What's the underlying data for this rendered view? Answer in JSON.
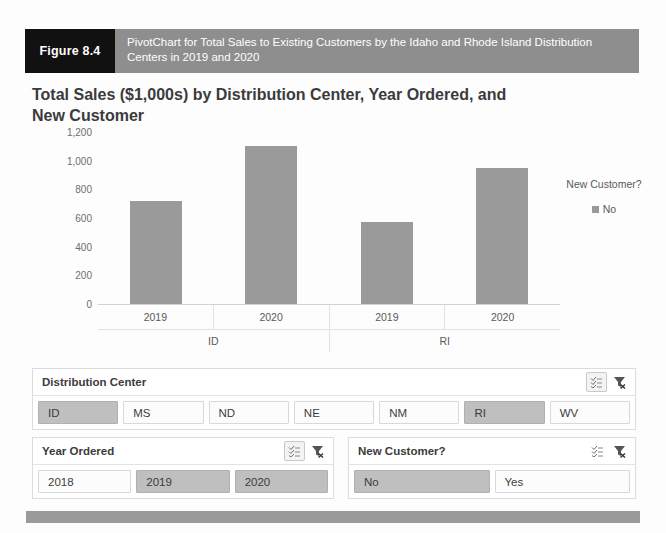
{
  "figure": {
    "number_label": "Figure 8.4",
    "caption": "PivotChart for Total Sales to Existing Customers by the Idaho and Rhode Island Distribution Centers in 2019 and 2020"
  },
  "chart_data": {
    "type": "bar",
    "title": "Total Sales ($1,000s) by Distribution Center, Year Ordered, and New Customer",
    "xlabel": "",
    "ylabel": "",
    "ylim": [
      0,
      1200
    ],
    "yticks": [
      "0",
      "200",
      "400",
      "600",
      "800",
      "1,000",
      "1,200"
    ],
    "ytick_values": [
      0,
      200,
      400,
      600,
      800,
      1000,
      1200
    ],
    "grid": false,
    "legend_position": "right",
    "legend_title": "New Customer?",
    "legend_entries": [
      {
        "label": "No",
        "color": "#9a9a9a"
      }
    ],
    "groups": [
      {
        "label": "ID",
        "categories": [
          "2019",
          "2020"
        ]
      },
      {
        "label": "RI",
        "categories": [
          "2019",
          "2020"
        ]
      }
    ],
    "categories": [
      "2019",
      "2020",
      "2019",
      "2020"
    ],
    "series": [
      {
        "name": "No",
        "color": "#9a9a9a",
        "values": [
          720,
          1100,
          570,
          950
        ]
      }
    ]
  },
  "slicers": [
    {
      "id": "distribution-center",
      "title": "Distribution Center",
      "multiselect_icon": "multi-select-icon",
      "clear_icon": "clear-filter-icon",
      "items": [
        {
          "label": "ID",
          "selected": true
        },
        {
          "label": "MS",
          "selected": false
        },
        {
          "label": "ND",
          "selected": false
        },
        {
          "label": "NE",
          "selected": false
        },
        {
          "label": "NM",
          "selected": false
        },
        {
          "label": "RI",
          "selected": true
        },
        {
          "label": "WV",
          "selected": false
        }
      ]
    },
    {
      "id": "year-ordered",
      "title": "Year Ordered",
      "multiselect_icon": "multi-select-icon",
      "clear_icon": "clear-filter-icon",
      "items": [
        {
          "label": "2018",
          "selected": false
        },
        {
          "label": "2019",
          "selected": true
        },
        {
          "label": "2020",
          "selected": true
        }
      ]
    },
    {
      "id": "new-customer",
      "title": "New Customer?",
      "multiselect_icon": "multi-select-icon",
      "clear_icon": "clear-filter-icon",
      "items": [
        {
          "label": "No",
          "selected": true
        },
        {
          "label": "Yes",
          "selected": false
        }
      ]
    }
  ],
  "colors": {
    "bar": "#9a9a9a",
    "caption_bar": "#8e8e8e",
    "figure_label_bg": "#111111",
    "selected_tile": "#bfbfbf"
  }
}
